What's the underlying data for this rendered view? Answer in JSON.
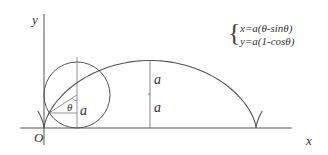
{
  "diagram": {
    "type": "cycloid",
    "axis_labels": {
      "x": "x",
      "y": "y",
      "origin": "O"
    },
    "equations": [
      "x=a(θ-sinθ)",
      "y=a(1-cosθ)"
    ],
    "labels": {
      "theta": "θ",
      "radius": "a",
      "height_upper": "a",
      "height_lower": "a"
    },
    "colors": {
      "stroke": "#555555",
      "text": "#333333"
    }
  }
}
